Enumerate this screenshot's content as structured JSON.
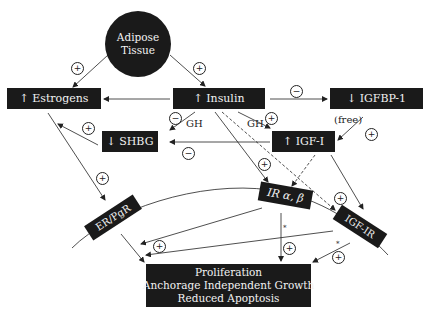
{
  "nodes": {
    "adipose": {
      "line1": "Adipose",
      "line2": "Tissue"
    },
    "estrogens": "↑ Estrogens",
    "insulin": "↑ Insulin",
    "igfbp1": "↓ IGFBP-1",
    "shbg": "↓ SHBG",
    "igf1": "↑ IGF-I",
    "ir": "IR α, β",
    "erpgr": "ER/PgR",
    "igf1r": "IGF-IR",
    "outcome": {
      "line1": "Proliferation",
      "line2": "Anchorage Independent Growth",
      "line3": "Reduced Apoptosis"
    }
  },
  "labels": {
    "gh_left": "GH",
    "gh_right": "GH",
    "free": "(free)",
    "star": "*"
  },
  "signs": {
    "plus": "+",
    "minus": "−"
  }
}
